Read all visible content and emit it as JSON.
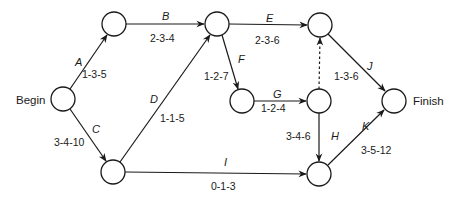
{
  "diagram": {
    "type": "PERT activity-on-arrow network",
    "terminals": {
      "begin": "Begin",
      "finish": "Finish"
    },
    "nodes": [
      {
        "id": "n1",
        "x": 63,
        "y": 99
      },
      {
        "id": "n2",
        "x": 114,
        "y": 24
      },
      {
        "id": "n3",
        "x": 217,
        "y": 24
      },
      {
        "id": "n4",
        "x": 113,
        "y": 172
      },
      {
        "id": "n5",
        "x": 242,
        "y": 101
      },
      {
        "id": "n6",
        "x": 320,
        "y": 25
      },
      {
        "id": "n7",
        "x": 319,
        "y": 101
      },
      {
        "id": "n8",
        "x": 394,
        "y": 101
      },
      {
        "id": "n9",
        "x": 319,
        "y": 174
      }
    ],
    "activities": [
      {
        "name": "A",
        "times": "1-3-5",
        "from": "n1",
        "to": "n2"
      },
      {
        "name": "B",
        "times": "2-3-4",
        "from": "n2",
        "to": "n3"
      },
      {
        "name": "C",
        "times": "3-4-10",
        "from": "n1",
        "to": "n4"
      },
      {
        "name": "D",
        "times": "1-1-5",
        "from": "n4",
        "to": "n3"
      },
      {
        "name": "E",
        "times": "2-3-6",
        "from": "n3",
        "to": "n6"
      },
      {
        "name": "F",
        "times": "1-2-7",
        "from": "n3",
        "to": "n5"
      },
      {
        "name": "G",
        "times": "1-2-4",
        "from": "n5",
        "to": "n7"
      },
      {
        "name": "H",
        "times": "3-4-6",
        "from": "n7",
        "to": "n9"
      },
      {
        "name": "I",
        "times": "0-1-3",
        "from": "n4",
        "to": "n9"
      },
      {
        "name": "J",
        "times": "1-3-6",
        "from": "n6",
        "to": "n8"
      },
      {
        "name": "K",
        "times": "3-5-12",
        "from": "n9",
        "to": "n8"
      }
    ],
    "dummy": {
      "from": "n7",
      "to": "n6",
      "style": "dashed"
    }
  }
}
